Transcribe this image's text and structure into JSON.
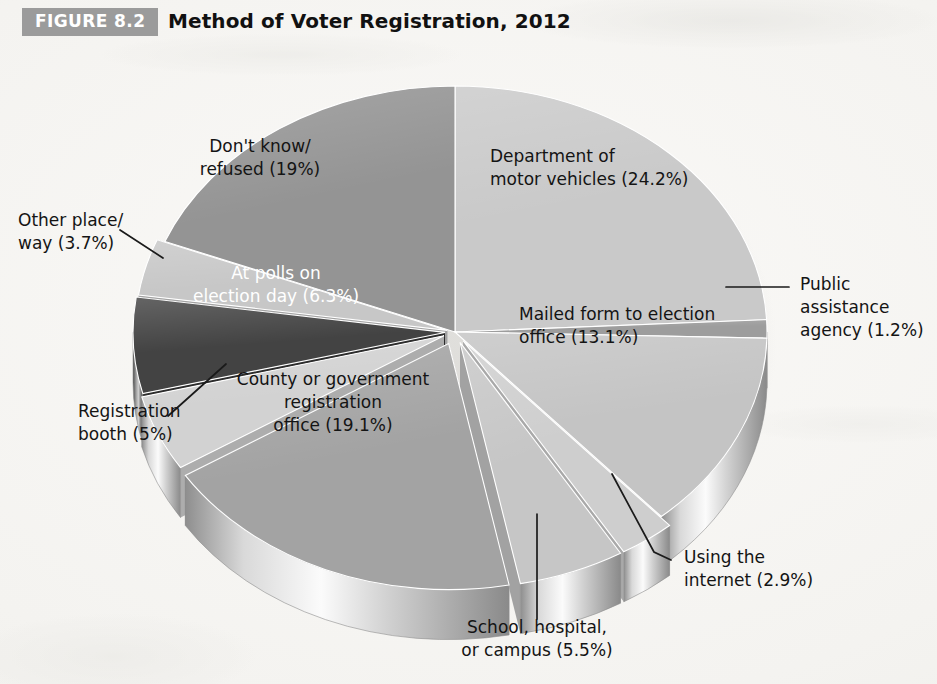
{
  "figure": {
    "badge": "FIGURE 8.2",
    "title": "Method of Voter Registration, 2012"
  },
  "colors": {
    "badge_bg": "#9b9b9b",
    "badge_text": "#ffffff",
    "page_bg": "#f6f5f2",
    "title_text": "#111111"
  },
  "chart_data": {
    "type": "pie",
    "title": "Method of Voter Registration, 2012",
    "subtitle": "",
    "xlabel": "",
    "ylabel": "",
    "legend_position": "none",
    "grid": false,
    "style": "3d-exploded-grayscale",
    "units": "percent",
    "total": 100.0,
    "categories": [
      "Department of motor vehicles",
      "Public assistance agency",
      "Mailed form to election office",
      "Using the internet",
      "School, hospital, or campus",
      "County or government registration office",
      "Registration booth",
      "At polls on election day",
      "Other place/way",
      "Don't know/refused"
    ],
    "values": [
      24.2,
      1.2,
      13.1,
      2.9,
      5.5,
      19.1,
      5.0,
      6.3,
      3.7,
      19.0
    ],
    "slices": [
      {
        "id": "dmv",
        "label_line1": "Department of",
        "label_line2": "motor vehicles (24.2%)",
        "label_line3": "",
        "value": 24.2,
        "value_text": "24.2%",
        "color": "#c9c9c9",
        "side_color": "#a7a7a7",
        "text_color": "#141414",
        "text_x": 490,
        "text_y": 118,
        "explode": 0,
        "leader": false
      },
      {
        "id": "public-assistance",
        "label_line1": "Public",
        "label_line2": "assistance",
        "label_line3": "agency (1.2%)",
        "value": 1.2,
        "value_text": "1.2%",
        "color": "#9d9d9d",
        "side_color": "#777777",
        "text_color": "#141414",
        "text_x": 800,
        "text_y": 246,
        "explode": 0,
        "leader": true
      },
      {
        "id": "mailed-form",
        "label_line1": "Mailed form to election",
        "label_line2": "office (13.1%)",
        "label_line3": "",
        "value": 13.1,
        "value_text": "13.1%",
        "color": "#c4c4c4",
        "side_color": "#9e9e9e",
        "text_color": "#141414",
        "text_x": 519,
        "text_y": 276,
        "explode": 0,
        "leader": false
      },
      {
        "id": "internet",
        "label_line1": "Using the",
        "label_line2": "internet (2.9%)",
        "label_line3": "",
        "value": 2.9,
        "value_text": "2.9%",
        "color": "#cecece",
        "side_color": "#a9a9a9",
        "text_color": "#141414",
        "text_x": 684,
        "text_y": 519,
        "explode": 14,
        "leader": true
      },
      {
        "id": "school-hospital-campus",
        "label_line1": "School, hospital,",
        "label_line2": "or campus (5.5%)",
        "label_line3": "",
        "value": 5.5,
        "value_text": "5.5%",
        "color": "#c6c6c6",
        "side_color": "#a2a2a2",
        "text_color": "#141414",
        "text_x": 537,
        "text_y": 589,
        "explode": 14,
        "leader": true
      },
      {
        "id": "county-gov-office",
        "label_line1": "County or government",
        "label_line2": "registration",
        "label_line3": "office (19.1%)",
        "value": 19.1,
        "value_text": "19.1%",
        "color": "#a3a3a3",
        "side_color": "#848484",
        "text_color": "#141414",
        "text_x": 333,
        "text_y": 341,
        "explode": 16,
        "leader": false
      },
      {
        "id": "registration-booth",
        "label_line1": "Registration",
        "label_line2": "booth (5%)",
        "label_line3": "",
        "value": 5.0,
        "value_text": "5%",
        "color": "#d2d2d2",
        "side_color": "#adadad",
        "text_color": "#141414",
        "text_x": 78,
        "text_y": 373,
        "explode": 12,
        "leader": true
      },
      {
        "id": "at-polls",
        "label_line1": "At polls on",
        "label_line2": "election day (6.3%)",
        "label_line3": "",
        "value": 6.3,
        "value_text": "6.3%",
        "color": "#434343",
        "side_color": "#2c2c2c",
        "text_color": "#ffffff",
        "text_x": 276,
        "text_y": 235,
        "explode": 10,
        "leader": false
      },
      {
        "id": "other-place-way",
        "label_line1": "Other place/",
        "label_line2": "way (3.7%)",
        "label_line3": "",
        "value": 3.7,
        "value_text": "3.7%",
        "color": "#c7c7c7",
        "side_color": "#a2a2a2",
        "text_color": "#141414",
        "text_x": 18,
        "text_y": 182,
        "explode": 8,
        "leader": true
      },
      {
        "id": "dont-know-refused",
        "label_line1": "Don't know/",
        "label_line2": "refused (19%)",
        "label_line3": "",
        "value": 19.0,
        "value_text": "19%",
        "color": "#949494",
        "side_color": "#767676",
        "text_color": "#141414",
        "text_x": 260,
        "text_y": 108,
        "explode": 0,
        "leader": false
      }
    ]
  }
}
